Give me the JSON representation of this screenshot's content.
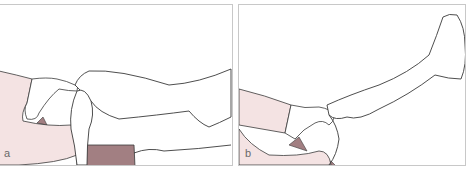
{
  "figure": {
    "panels": [
      {
        "id": "a",
        "label": "a",
        "description": "Examiner supports flexed knee; patient's leg bent with foot near examiner's hands"
      },
      {
        "id": "b",
        "label": "b",
        "description": "Examiner supports knee while patient's leg is extended upward"
      }
    ],
    "colors": {
      "skin_fill": "#f4e3e3",
      "clothing_fill": "#a27f82",
      "outline": "#3a3a3a",
      "border": "#c8c8c8",
      "label": "#6a6a6a"
    }
  }
}
